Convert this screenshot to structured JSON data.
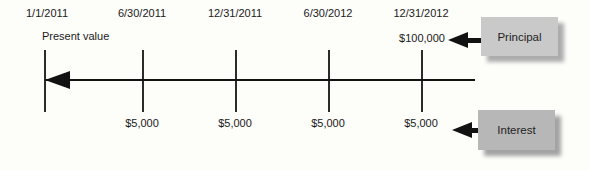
{
  "figure": {
    "dates": [
      "1/1/2011",
      "6/30/2011",
      "12/31/2011",
      "6/30/2012",
      "12/31/2012"
    ],
    "present_value_label": "Present value",
    "principal": {
      "amount": "$100,000",
      "box_label": "Principal"
    },
    "interest": {
      "amounts": [
        "$5,000",
        "$5,000",
        "$5,000",
        "$5,000"
      ],
      "box_label": "Interest"
    },
    "colors": {
      "ink": "#121212",
      "principal_box_fill": "#c9c9c9",
      "interest_box_fill": "#b7b7b7",
      "box_shadow": "#a8a8a8",
      "background": "#fdfdfa"
    }
  }
}
